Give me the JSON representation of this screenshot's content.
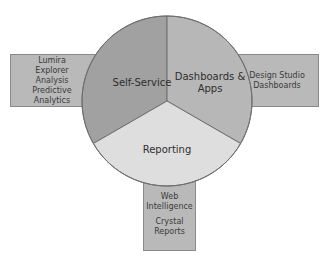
{
  "diagram": {
    "segments": [
      {
        "label": "Self-Service",
        "color": "#a1a1a1"
      },
      {
        "label": "Dashboards & Apps",
        "line1": "Dashboards &",
        "line2": "Apps",
        "color": "#b7b7b7"
      },
      {
        "label": "Reporting",
        "color": "#dedede"
      }
    ],
    "boxes": {
      "self_service_tools": [
        "Lumira",
        "Explorer",
        "Analysis",
        "Predictive Analytics"
      ],
      "dashboards_tools": [
        "Design Studio",
        "Dashboards"
      ],
      "reporting_tools": {
        "group1": [
          "Web",
          "Intelligence"
        ],
        "group2": [
          "Crystal",
          "Reports"
        ]
      }
    },
    "colors": {
      "box_fill": "#b9b9b9",
      "outline": "#6f6f6f"
    }
  }
}
